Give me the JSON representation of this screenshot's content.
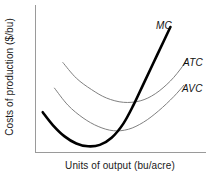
{
  "chart_data": {
    "type": "line",
    "title": "",
    "xlabel": "Units of output (bu/acre)",
    "ylabel": "Costs of production ($/bu)",
    "xlim": [
      0,
      100
    ],
    "ylim": [
      0,
      100
    ],
    "grid": false,
    "axis_ticks": false,
    "legend_position": "inline-right-of-curve-ends",
    "series": [
      {
        "name": "MC",
        "label": "MC",
        "color": "#000000",
        "width": 2.6,
        "description": "Marginal cost: steep U-shape, lowest minimum, rises sharply through AVC and ATC minima",
        "points": [
          {
            "x": 4,
            "y": 28
          },
          {
            "x": 10,
            "y": 19
          },
          {
            "x": 17,
            "y": 11
          },
          {
            "x": 24,
            "y": 6
          },
          {
            "x": 31,
            "y": 4
          },
          {
            "x": 38,
            "y": 5
          },
          {
            "x": 45,
            "y": 10
          },
          {
            "x": 52,
            "y": 20
          },
          {
            "x": 58,
            "y": 33
          },
          {
            "x": 64,
            "y": 48
          },
          {
            "x": 70,
            "y": 63
          },
          {
            "x": 76,
            "y": 78
          },
          {
            "x": 80,
            "y": 88
          }
        ]
      },
      {
        "name": "ATC",
        "label": "ATC",
        "color": "#808080",
        "width": 1,
        "description": "Average total cost: broad U-shape, highest curve, minimum to the right of AVC minimum",
        "points": [
          {
            "x": 16,
            "y": 63
          },
          {
            "x": 24,
            "y": 52
          },
          {
            "x": 33,
            "y": 44
          },
          {
            "x": 42,
            "y": 38
          },
          {
            "x": 52,
            "y": 35
          },
          {
            "x": 62,
            "y": 36
          },
          {
            "x": 71,
            "y": 41
          },
          {
            "x": 80,
            "y": 50
          },
          {
            "x": 87,
            "y": 60
          },
          {
            "x": 90,
            "y": 66
          }
        ]
      },
      {
        "name": "AVC",
        "label": "AVC",
        "color": "#808080",
        "width": 1,
        "description": "Average variable cost: broad U-shape below ATC, minimum left of ATC minimum, converges toward ATC at high output",
        "points": [
          {
            "x": 11,
            "y": 45
          },
          {
            "x": 19,
            "y": 33
          },
          {
            "x": 28,
            "y": 24
          },
          {
            "x": 37,
            "y": 18
          },
          {
            "x": 46,
            "y": 15
          },
          {
            "x": 55,
            "y": 16
          },
          {
            "x": 64,
            "y": 21
          },
          {
            "x": 73,
            "y": 29
          },
          {
            "x": 82,
            "y": 39
          },
          {
            "x": 88,
            "y": 47
          }
        ]
      }
    ]
  },
  "labels": {
    "mc": "MC",
    "atc": "ATC",
    "avc": "AVC"
  },
  "axes": {
    "x_title": "Units of output (bu/acre)",
    "y_title": "Costs of production ($/bu)",
    "line_color": "#9a9a9a"
  }
}
